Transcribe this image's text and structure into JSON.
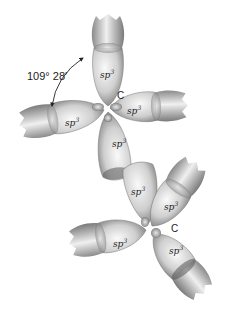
{
  "diagram": {
    "angle_label": "109° 28′",
    "carbon_label": "C",
    "orbital_label_base": "sp",
    "orbital_label_sup": "3",
    "colors": {
      "background": "#ffffff",
      "lobe_light": "#f2f2f2",
      "lobe_dark": "#6a6a6a",
      "text": "#222222"
    },
    "upper_carbon": {
      "label": "C",
      "orbitals": [
        "sp3",
        "sp3",
        "sp3",
        "sp3"
      ]
    },
    "lower_carbon": {
      "label": "C",
      "orbitals": [
        "sp3",
        "sp3",
        "sp3",
        "sp3"
      ]
    }
  }
}
